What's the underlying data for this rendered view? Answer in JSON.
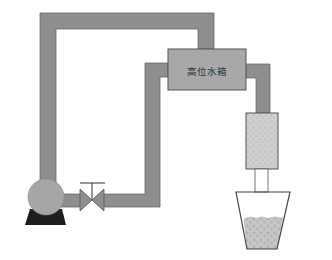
{
  "diagram": {
    "title": "",
    "tank": {
      "label": "高位水箱"
    },
    "components": [
      {
        "id": "pump",
        "name": "pump"
      },
      {
        "id": "valve",
        "name": "valve"
      },
      {
        "id": "tank",
        "name": "high-level water tank",
        "label": "高位水箱"
      },
      {
        "id": "filter",
        "name": "filter column"
      },
      {
        "id": "beaker",
        "name": "collection beaker"
      }
    ],
    "colors": {
      "pipe": "#8e8e8e",
      "pipe_edge": "#6a6a6a",
      "tank": "#a8a8a8",
      "pump": "#a6a6a6",
      "pump_base": "#1e1e1e",
      "filter": "#cfcfcf",
      "sediment": "#c4c4c4"
    }
  }
}
